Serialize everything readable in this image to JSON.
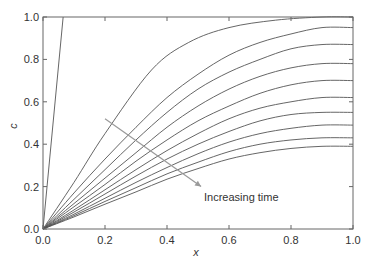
{
  "chart_data": {
    "type": "line",
    "title": "",
    "xlabel": "x",
    "ylabel": "c",
    "xlim": [
      0.0,
      1.0
    ],
    "ylim": [
      0.0,
      1.0
    ],
    "xticks": [
      "0.0",
      "0.2",
      "0.4",
      "0.6",
      "0.8",
      "1.0"
    ],
    "yticks": [
      "0.0",
      "0.2",
      "0.4",
      "0.6",
      "0.8",
      "1.0"
    ],
    "grid": false,
    "legend": null,
    "annotation": {
      "text": "Increasing time",
      "arrow_from": [
        0.2,
        0.52
      ],
      "arrow_to": [
        0.51,
        0.2
      ]
    },
    "colors": {
      "line": "#555555",
      "arrow": "#9a9a9a",
      "axis": "#666666"
    },
    "series": [
      {
        "name": "t1",
        "x": [
          0.0,
          0.065
        ],
        "y": [
          0.0,
          1.0
        ]
      },
      {
        "name": "t2",
        "x": [
          0.0,
          0.1,
          0.2,
          0.35,
          0.47,
          0.6,
          0.75,
          0.9,
          1.0
        ],
        "y": [
          0.0,
          0.22,
          0.45,
          0.75,
          0.88,
          0.95,
          0.985,
          1.0,
          1.0
        ]
      },
      {
        "name": "t3",
        "x": [
          0.0,
          0.1,
          0.2,
          0.3,
          0.4,
          0.5,
          0.6,
          0.7,
          0.8,
          0.9,
          1.0
        ],
        "y": [
          0.0,
          0.17,
          0.33,
          0.48,
          0.62,
          0.73,
          0.82,
          0.88,
          0.92,
          0.95,
          0.95
        ]
      },
      {
        "name": "t4",
        "x": [
          0.0,
          0.1,
          0.2,
          0.3,
          0.4,
          0.5,
          0.6,
          0.7,
          0.8,
          0.9,
          1.0
        ],
        "y": [
          0.0,
          0.14,
          0.28,
          0.42,
          0.55,
          0.66,
          0.74,
          0.8,
          0.85,
          0.87,
          0.87
        ]
      },
      {
        "name": "t5",
        "x": [
          0.0,
          0.1,
          0.2,
          0.3,
          0.4,
          0.5,
          0.6,
          0.7,
          0.8,
          0.9,
          1.0
        ],
        "y": [
          0.0,
          0.12,
          0.24,
          0.36,
          0.48,
          0.58,
          0.66,
          0.72,
          0.76,
          0.78,
          0.78
        ]
      },
      {
        "name": "t6",
        "x": [
          0.0,
          0.1,
          0.2,
          0.3,
          0.4,
          0.5,
          0.6,
          0.7,
          0.8,
          0.9,
          1.0
        ],
        "y": [
          0.0,
          0.105,
          0.21,
          0.32,
          0.42,
          0.51,
          0.58,
          0.64,
          0.68,
          0.7,
          0.7
        ]
      },
      {
        "name": "t7",
        "x": [
          0.0,
          0.1,
          0.2,
          0.3,
          0.4,
          0.5,
          0.6,
          0.7,
          0.8,
          0.9,
          1.0
        ],
        "y": [
          0.0,
          0.09,
          0.185,
          0.28,
          0.37,
          0.45,
          0.52,
          0.57,
          0.6,
          0.62,
          0.62
        ]
      },
      {
        "name": "t8",
        "x": [
          0.0,
          0.1,
          0.2,
          0.3,
          0.4,
          0.5,
          0.6,
          0.7,
          0.8,
          0.9,
          1.0
        ],
        "y": [
          0.0,
          0.08,
          0.165,
          0.25,
          0.33,
          0.4,
          0.46,
          0.51,
          0.54,
          0.55,
          0.55
        ]
      },
      {
        "name": "t9",
        "x": [
          0.0,
          0.1,
          0.2,
          0.3,
          0.4,
          0.5,
          0.6,
          0.7,
          0.8,
          0.9,
          1.0
        ],
        "y": [
          0.0,
          0.07,
          0.145,
          0.22,
          0.29,
          0.355,
          0.41,
          0.45,
          0.475,
          0.49,
          0.49
        ]
      },
      {
        "name": "t10",
        "x": [
          0.0,
          0.1,
          0.2,
          0.3,
          0.4,
          0.5,
          0.6,
          0.7,
          0.8,
          0.9,
          1.0
        ],
        "y": [
          0.0,
          0.063,
          0.13,
          0.195,
          0.26,
          0.315,
          0.365,
          0.4,
          0.42,
          0.43,
          0.43
        ]
      },
      {
        "name": "t11",
        "x": [
          0.0,
          0.1,
          0.2,
          0.3,
          0.4,
          0.5,
          0.6,
          0.7,
          0.8,
          0.9,
          1.0
        ],
        "y": [
          0.0,
          0.057,
          0.117,
          0.175,
          0.235,
          0.285,
          0.33,
          0.36,
          0.38,
          0.39,
          0.39
        ]
      }
    ]
  }
}
